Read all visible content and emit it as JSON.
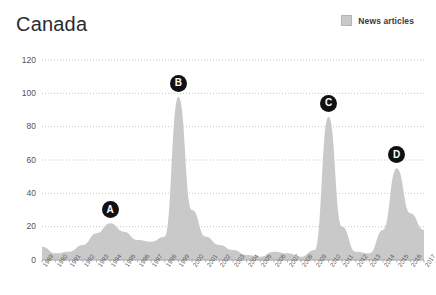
{
  "title": "Canada",
  "legend": {
    "items": [
      {
        "label": "News articles",
        "color": "#c9c9c9",
        "icon": "square-swatch-icon"
      }
    ]
  },
  "chart_data": {
    "type": "area",
    "title": "Canada",
    "xlabel": "",
    "ylabel": "",
    "ylim": [
      0,
      120
    ],
    "yticks": [
      0,
      20,
      40,
      60,
      80,
      100,
      120
    ],
    "grid": true,
    "legend_position": "top-right",
    "series": [
      {
        "name": "News articles",
        "color": "#c9c9c9",
        "categories": [
          "1989",
          "1990",
          "1991",
          "1992",
          "1993",
          "1994",
          "1995",
          "1996",
          "1997",
          "1998",
          "1999",
          "2000",
          "2001",
          "2002",
          "2003",
          "2004",
          "2005",
          "2006",
          "2007",
          "2008",
          "2009",
          "2010",
          "2011",
          "2012",
          "2013",
          "2014",
          "2015",
          "2016",
          "2017"
        ],
        "values": [
          8,
          4,
          5,
          9,
          16,
          22,
          17,
          12,
          11,
          14,
          98,
          30,
          14,
          9,
          6,
          3,
          2,
          5,
          4,
          2,
          6,
          86,
          20,
          5,
          4,
          18,
          55,
          28,
          18
        ]
      }
    ],
    "annotations": [
      {
        "label": "A",
        "category": "1994",
        "value": 22
      },
      {
        "label": "B",
        "category": "1999",
        "value": 98
      },
      {
        "label": "C",
        "category": "2010",
        "value": 86
      },
      {
        "label": "D",
        "category": "2015",
        "value": 55
      }
    ]
  }
}
